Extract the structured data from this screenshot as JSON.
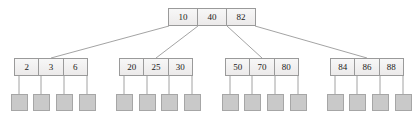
{
  "diagram": {
    "type": "b-tree",
    "colors": {
      "node_fill": "#f2f2f2",
      "node_border": "#9a9a9a",
      "leaf_fill": "#c9c9c9",
      "leaf_border": "#a6a6a6",
      "edge": "#8c8c8c",
      "text": "#1a1a1a",
      "background": "#ffffff"
    },
    "root": {
      "id": "root",
      "keys": [
        "10",
        "40",
        "82"
      ],
      "x": 168,
      "y": 8,
      "width": 88,
      "height": 18
    },
    "internal_nodes": [
      {
        "id": "node-1",
        "keys": [
          "2",
          "3",
          "6"
        ],
        "x": 14,
        "y": 58,
        "width": 74,
        "height": 18
      },
      {
        "id": "node-2",
        "keys": [
          "20",
          "25",
          "30"
        ],
        "x": 119,
        "y": 58,
        "width": 74,
        "height": 18
      },
      {
        "id": "node-3",
        "keys": [
          "50",
          "70",
          "80"
        ],
        "x": 225,
        "y": 58,
        "width": 74,
        "height": 18
      },
      {
        "id": "node-4",
        "keys": [
          "84",
          "86",
          "88"
        ],
        "x": 330,
        "y": 58,
        "width": 74,
        "height": 18
      }
    ],
    "leaves": [
      {
        "id": "leaf-1",
        "parent": "node-1",
        "x": 11,
        "y": 94
      },
      {
        "id": "leaf-2",
        "parent": "node-1",
        "x": 33,
        "y": 94
      },
      {
        "id": "leaf-3",
        "parent": "node-1",
        "x": 56,
        "y": 94
      },
      {
        "id": "leaf-4",
        "parent": "node-1",
        "x": 79,
        "y": 94
      },
      {
        "id": "leaf-5",
        "parent": "node-2",
        "x": 116,
        "y": 94
      },
      {
        "id": "leaf-6",
        "parent": "node-2",
        "x": 139,
        "y": 94
      },
      {
        "id": "leaf-7",
        "parent": "node-2",
        "x": 161,
        "y": 94
      },
      {
        "id": "leaf-8",
        "parent": "node-2",
        "x": 184,
        "y": 94
      },
      {
        "id": "leaf-9",
        "parent": "node-3",
        "x": 222,
        "y": 94
      },
      {
        "id": "leaf-10",
        "parent": "node-3",
        "x": 244,
        "y": 94
      },
      {
        "id": "leaf-11",
        "parent": "node-3",
        "x": 267,
        "y": 94
      },
      {
        "id": "leaf-12",
        "parent": "node-3",
        "x": 290,
        "y": 94
      },
      {
        "id": "leaf-13",
        "parent": "node-4",
        "x": 327,
        "y": 94
      },
      {
        "id": "leaf-14",
        "parent": "node-4",
        "x": 349,
        "y": 94
      },
      {
        "id": "leaf-15",
        "parent": "node-4",
        "x": 372,
        "y": 94
      },
      {
        "id": "leaf-16",
        "parent": "node-4",
        "x": 395,
        "y": 94
      }
    ],
    "root_edges": [
      {
        "id": "root-edge-1",
        "x1": 169,
        "y1": 26,
        "x2": 51,
        "y2": 58
      },
      {
        "id": "root-edge-2",
        "x1": 198,
        "y1": 26,
        "x2": 156,
        "y2": 58
      },
      {
        "id": "root-edge-3",
        "x1": 227,
        "y1": 26,
        "x2": 262,
        "y2": 58
      },
      {
        "id": "root-edge-4",
        "x1": 255,
        "y1": 26,
        "x2": 367,
        "y2": 58
      }
    ],
    "leaf_edges": [
      {
        "id": "leaf-edge-1",
        "x": 19,
        "y1": 76,
        "y2": 94
      },
      {
        "id": "leaf-edge-2",
        "x": 41,
        "y1": 76,
        "y2": 94
      },
      {
        "id": "leaf-edge-3",
        "x": 64,
        "y1": 76,
        "y2": 94
      },
      {
        "id": "leaf-edge-4",
        "x": 87,
        "y1": 76,
        "y2": 94
      },
      {
        "id": "leaf-edge-5",
        "x": 124,
        "y1": 76,
        "y2": 94
      },
      {
        "id": "leaf-edge-6",
        "x": 147,
        "y1": 76,
        "y2": 94
      },
      {
        "id": "leaf-edge-7",
        "x": 169,
        "y1": 76,
        "y2": 94
      },
      {
        "id": "leaf-edge-8",
        "x": 192,
        "y1": 76,
        "y2": 94
      },
      {
        "id": "leaf-edge-9",
        "x": 230,
        "y1": 76,
        "y2": 94
      },
      {
        "id": "leaf-edge-10",
        "x": 252,
        "y1": 76,
        "y2": 94
      },
      {
        "id": "leaf-edge-11",
        "x": 275,
        "y1": 76,
        "y2": 94
      },
      {
        "id": "leaf-edge-12",
        "x": 298,
        "y1": 76,
        "y2": 94
      },
      {
        "id": "leaf-edge-13",
        "x": 335,
        "y1": 76,
        "y2": 94
      },
      {
        "id": "leaf-edge-14",
        "x": 357,
        "y1": 76,
        "y2": 94
      },
      {
        "id": "leaf-edge-15",
        "x": 380,
        "y1": 76,
        "y2": 94
      },
      {
        "id": "leaf-edge-16",
        "x": 403,
        "y1": 76,
        "y2": 94
      }
    ]
  }
}
